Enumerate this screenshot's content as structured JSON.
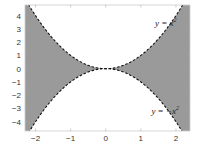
{
  "chart_data": {
    "type": "area",
    "title": "",
    "xlabel": "",
    "ylabel": "",
    "xlim": [
      -2.3,
      2.4
    ],
    "ylim": [
      -4.7,
      4.8
    ],
    "xticks": [
      -2,
      -1,
      0,
      1,
      2
    ],
    "yticks": [
      -4,
      -3,
      -2,
      -1,
      0,
      1,
      2,
      3,
      4
    ],
    "xtick_labels": [
      "-2",
      "-1",
      "0",
      "1",
      "2"
    ],
    "ytick_labels": [
      "-4",
      "-3",
      "-2",
      "-1",
      "0",
      "1",
      "2",
      "3",
      "4"
    ],
    "grid": false,
    "legend": null,
    "series": [
      {
        "name": "y = x^2",
        "function": "x^2",
        "style": "dashed",
        "color": "#111111"
      },
      {
        "name": "y = -x^2",
        "function": "-x^2",
        "style": "dashed",
        "color": "#111111"
      }
    ],
    "shaded_region": {
      "description": "region between y = -x^2 and y = x^2",
      "condition": "-x^2 <= y <= x^2",
      "color": "#9a9a9a"
    },
    "annotations": [
      {
        "text": "y = x",
        "superscript": "2",
        "x": 1.4,
        "y": 3.2
      },
      {
        "text": "y = −x",
        "superscript": "2",
        "x": 1.3,
        "y": -3.4
      }
    ]
  },
  "colors": {
    "fill": "#9a9a9a",
    "curve": "#111111",
    "frame": "#cccccc",
    "background": "#ffffff"
  }
}
